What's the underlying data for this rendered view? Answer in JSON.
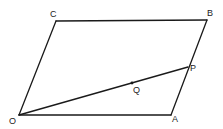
{
  "diagram": {
    "type": "geometry-parallelogram",
    "points": {
      "O": {
        "label": "O",
        "x": 19,
        "y": 115
      },
      "A": {
        "label": "A",
        "x": 171,
        "y": 115
      },
      "B": {
        "label": "B",
        "x": 207,
        "y": 20
      },
      "C": {
        "label": "C",
        "x": 56,
        "y": 21
      },
      "P": {
        "label": "P",
        "x": 188,
        "y": 67
      },
      "Q": {
        "label": "Q",
        "x": 132,
        "y": 83
      }
    },
    "segments": [
      [
        "O",
        "A"
      ],
      [
        "A",
        "B"
      ],
      [
        "B",
        "C"
      ],
      [
        "C",
        "O"
      ],
      [
        "O",
        "P"
      ]
    ],
    "marked_points": [
      "Q"
    ],
    "stroke_color": "#1a1a1a",
    "background": "#ffffff"
  }
}
